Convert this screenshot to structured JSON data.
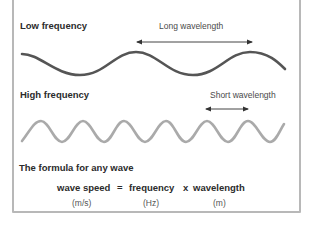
{
  "low_frequency": {
    "label": "Low frequency",
    "wavelength_label": "Long wavelength",
    "wave_color": "#555555"
  },
  "high_frequency": {
    "label": "High frequency",
    "wavelength_label": "Short wavelength",
    "wave_color": "#aaaaaa"
  },
  "formula": {
    "heading": "The formula for any wave",
    "term_1": "wave speed",
    "equals": "=",
    "term_2": "frequency",
    "times": "x",
    "term_3": "wavelength",
    "unit_1": "(m/s)",
    "unit_2": "(Hz)",
    "unit_3": "(m)"
  },
  "colors": {
    "border": "#b8b8b8",
    "text": "#2b2b2b",
    "arrow": "#333333"
  }
}
